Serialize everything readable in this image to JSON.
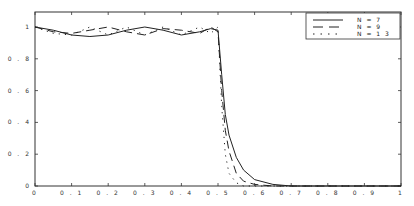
{
  "chart_data": {
    "type": "line",
    "title": "",
    "xlabel": "",
    "ylabel": "",
    "xlim": [
      0,
      1
    ],
    "ylim": [
      0,
      1.1
    ],
    "grid": false,
    "legend_position": "upper right",
    "x_ticks": [
      "0",
      "0.1",
      "0.2",
      "0.3",
      "0.4",
      "0.5",
      "0.6",
      "0.7",
      "0.8",
      "0.9",
      "1"
    ],
    "y_ticks": [
      "0",
      "0.2",
      "0.4",
      "0.6",
      "0.8",
      "1"
    ],
    "x": [
      0,
      0.05,
      0.1,
      0.15,
      0.2,
      0.25,
      0.3,
      0.35,
      0.4,
      0.45,
      0.48,
      0.5,
      0.51,
      0.52,
      0.53,
      0.55,
      0.57,
      0.6,
      0.65,
      0.7,
      0.8,
      1.0
    ],
    "series": [
      {
        "name": "N = 7",
        "style": "solid",
        "values": [
          1.0,
          0.98,
          0.95,
          0.94,
          0.95,
          0.98,
          1.0,
          0.98,
          0.95,
          0.97,
          0.99,
          0.98,
          0.7,
          0.45,
          0.32,
          0.18,
          0.1,
          0.04,
          0.01,
          0.0,
          0.0,
          0.0
        ]
      },
      {
        "name": "N = 9",
        "style": "dashed",
        "values": [
          1.0,
          0.97,
          0.96,
          0.98,
          1.0,
          0.97,
          0.95,
          0.99,
          0.98,
          0.96,
          1.0,
          0.97,
          0.6,
          0.35,
          0.22,
          0.08,
          0.03,
          0.01,
          0.0,
          0.0,
          0.0,
          0.0
        ]
      },
      {
        "name": "N = 13",
        "style": "dotted",
        "values": [
          1.0,
          0.96,
          0.95,
          1.0,
          0.95,
          1.0,
          0.95,
          1.0,
          0.95,
          1.0,
          0.96,
          1.0,
          0.5,
          0.2,
          0.08,
          0.02,
          0.0,
          0.0,
          0.0,
          0.0,
          0.0,
          0.0
        ]
      }
    ]
  },
  "legend": {
    "items": [
      {
        "label": "N = 7",
        "style": "solid"
      },
      {
        "label": "N = 9",
        "style": "dashed"
      },
      {
        "label": "N = 1 3",
        "style": "dotted"
      }
    ]
  },
  "axes": {
    "x_tick_labels": [
      "0",
      "0 . 1",
      "0 . 2",
      "0 . 3",
      "0 . 4",
      "0 . 5",
      "0 . 6",
      "0 . 7",
      "0 . 8",
      "0 . 9",
      "1"
    ],
    "y_tick_labels": [
      "0",
      "0 . 2",
      "0 . 4",
      "0 . 6",
      "0 . 8",
      "1"
    ]
  }
}
